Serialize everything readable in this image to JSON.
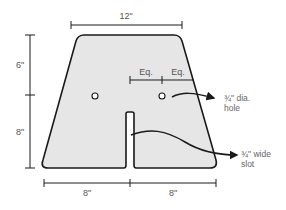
{
  "diagram": {
    "type": "dimensioned-part-drawing",
    "shape": "trapezoid plate with center slot and two holes",
    "colors": {
      "fill": "#e6e6e6",
      "stroke": "#1a1a1a",
      "text": "#555555"
    },
    "dimensions": {
      "top_width": "12\"",
      "upper_height": "6\"",
      "lower_height": "8\"",
      "bottom_left": "8\"",
      "bottom_right": "8\""
    },
    "spacing": {
      "left": "Eq.",
      "right": "Eq."
    },
    "callouts": {
      "hole_line1": "¾\" dia.",
      "hole_line2": "hole",
      "slot_line1": "¾\" wide",
      "slot_line2": "slot"
    }
  }
}
